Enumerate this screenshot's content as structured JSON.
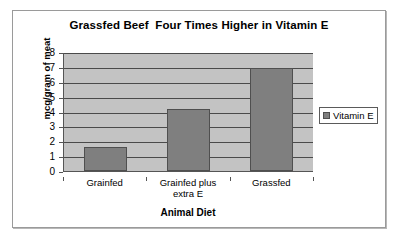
{
  "chart_data": {
    "type": "bar",
    "title": "Grassfed Beef  Four Times Higher in Vitamin E",
    "categories": [
      "Grainfed",
      "Grainfed plus extra E",
      "Grassfed"
    ],
    "values": [
      1.6,
      4.2,
      7.0
    ],
    "series": [
      {
        "name": "Vitamin E",
        "values": [
          1.6,
          4.2,
          7.0
        ]
      }
    ],
    "xlabel": "Animal Diet",
    "ylabel": "mcg/gram of meat",
    "ylim": [
      0,
      8
    ],
    "ytick_labels": [
      "0",
      "1",
      "2",
      "3",
      "4",
      "5",
      "6",
      "7",
      "8"
    ],
    "ytick_values": [
      0,
      1,
      2,
      3,
      4,
      5,
      6,
      7,
      8
    ],
    "grid": true,
    "grid_axis": "y",
    "legend_entries": [
      "Vitamin E"
    ],
    "legend_position": "right",
    "colors": {
      "bar_fill": "#7f7f7f",
      "bar_border": "#4f4f4f",
      "plot_background": "#c3c3c3",
      "gridline": "#4a4a4a",
      "axis": "#555555",
      "frame_border": "#9a9a9a",
      "text": "#000000",
      "chart_background": "#ffffff"
    }
  },
  "legend": {
    "swatch_icon": "legend-square-icon",
    "items": [
      {
        "label": "Vitamin E"
      }
    ]
  }
}
